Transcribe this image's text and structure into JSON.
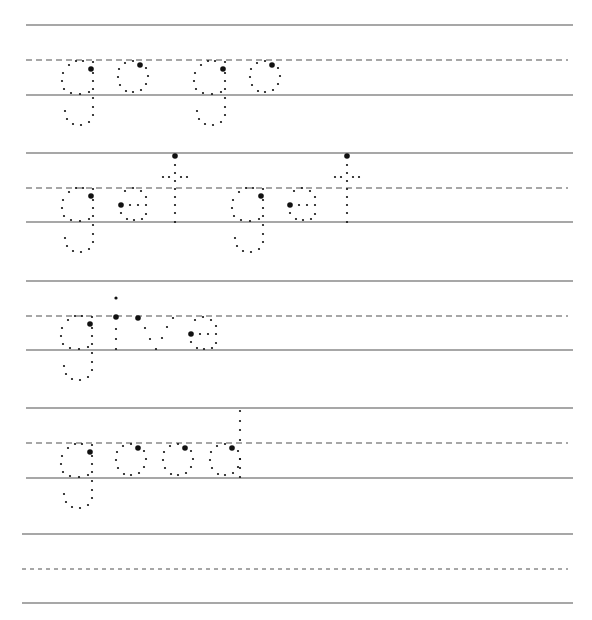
{
  "worksheet": {
    "title": "Tracing words practice",
    "rows": [
      {
        "words": [
          "go",
          "go"
        ]
      },
      {
        "words": [
          "get",
          "get"
        ]
      },
      {
        "words": [
          "give"
        ]
      },
      {
        "words": [
          "good"
        ]
      },
      {
        "words": []
      }
    ]
  },
  "colors": {
    "line": "#8a8a8a",
    "dash": "#8a8a8a",
    "dot": "#111111"
  }
}
